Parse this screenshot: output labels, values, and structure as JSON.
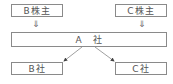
{
  "nodes": {
    "b_shareholder": "B株主",
    "c_shareholder": "C株主",
    "a_company": "A　社",
    "b_company": "B社",
    "c_company": "C社"
  },
  "arrows": {
    "down_glyph": "⇓"
  },
  "colors": {
    "border": "#8a8a8a",
    "text": "#555555",
    "line": "#777777"
  }
}
